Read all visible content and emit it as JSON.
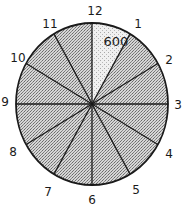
{
  "diagram": {
    "type": "clock-sector-diagram",
    "center": [
      92,
      104
    ],
    "rx": 76,
    "ry": 81,
    "colors": {
      "stroke": "#1a1a1a",
      "shaded": "#bdbdbd",
      "highlight": "#ececec"
    },
    "highlighted_sector": {
      "from": "12",
      "to": "1",
      "value_label": "600"
    },
    "hour_labels": [
      {
        "text": "12",
        "x": 95,
        "y": 11
      },
      {
        "text": "1",
        "x": 138,
        "y": 24
      },
      {
        "text": "2",
        "x": 169,
        "y": 60
      },
      {
        "text": "3",
        "x": 178,
        "y": 105
      },
      {
        "text": "4",
        "x": 169,
        "y": 154
      },
      {
        "text": "5",
        "x": 136,
        "y": 190
      },
      {
        "text": "6",
        "x": 92,
        "y": 200
      },
      {
        "text": "7",
        "x": 48,
        "y": 192
      },
      {
        "text": "8",
        "x": 13,
        "y": 152
      },
      {
        "text": "9",
        "x": 5,
        "y": 102
      },
      {
        "text": "10",
        "x": 18,
        "y": 58
      },
      {
        "text": "11",
        "x": 50,
        "y": 24
      }
    ]
  }
}
